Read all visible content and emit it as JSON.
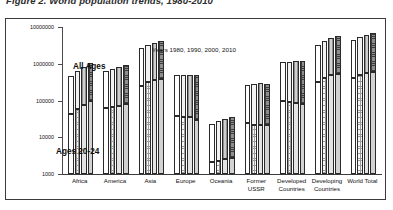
{
  "caption": "Figure 2.  World population trends, 1980-2010",
  "chart_data": {
    "type": "bar",
    "title": "",
    "subtitle": "Years 1980, 1990, 2000, 2010",
    "xlabel": "",
    "ylabel": "",
    "scale": "log",
    "ylim": [
      1000,
      10000000
    ],
    "ytick_labels": [
      "1000",
      "10000",
      "100000",
      "1000000",
      "10000000"
    ],
    "ytick_values": [
      1000,
      10000,
      100000,
      1000000,
      10000000
    ],
    "grid": false,
    "legend_position": "none",
    "legend_note": "Years 1980, 1990, 2000, 2010",
    "annotations": [
      "All Ages",
      "Ages 20-24"
    ],
    "series_years": [
      "1980",
      "1990",
      "2000",
      "2010"
    ],
    "stack_segments": [
      "Ages 20-24",
      "All Ages"
    ],
    "categories": [
      "Africa",
      "America",
      "Asia",
      "Europe",
      "Oceania",
      "Former\nUSSR",
      "Developed\nCountries",
      "Developing\nCountries",
      "World Total"
    ],
    "series": [
      {
        "name": "All Ages",
        "unit": "thousands",
        "values_by_category": {
          "Africa": [
            478000,
            633000,
            820000,
            1033000
          ],
          "America": [
            616000,
            724000,
            829000,
            926000
          ],
          "Asia": [
            2638000,
            3184000,
            3698000,
            4166000
          ],
          "Europe": [
            484000,
            498000,
            504000,
            499000
          ],
          "Oceania": [
            23000,
            27000,
            31000,
            36000
          ],
          "Former USSR": [
            265000,
            289000,
            291000,
            288000
          ],
          "Developed Countries": [
            1083000,
            1148000,
            1188000,
            1215000
          ],
          "Developing Countries": [
            3312000,
            4104000,
            4884000,
            5656000
          ],
          "World Total": [
            4440000,
            5280000,
            6080000,
            6870000
          ]
        }
      },
      {
        "name": "Ages 20-24",
        "unit": "thousands",
        "values_by_category": {
          "Africa": [
            43000,
            58000,
            77000,
            97000
          ],
          "America": [
            62000,
            67000,
            73000,
            80000
          ],
          "Asia": [
            250000,
            321000,
            357000,
            380000
          ],
          "Europe": [
            38000,
            36000,
            35000,
            30000
          ],
          "Oceania": [
            2100,
            2300,
            2500,
            2700
          ],
          "Former USSR": [
            24000,
            21000,
            21000,
            22000
          ],
          "Developed Countries": [
            97000,
            92000,
            87000,
            80000
          ],
          "Developing Countries": [
            320000,
            415000,
            480000,
            535000
          ],
          "World Total": [
            417000,
            507000,
            567000,
            615000
          ]
        }
      }
    ]
  }
}
